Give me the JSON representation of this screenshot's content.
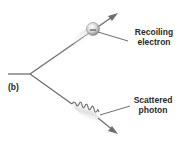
{
  "figure": {
    "panel_label": "(b)",
    "labels": {
      "electron": {
        "line1": "Recoiling",
        "line2": "electron"
      },
      "photon": {
        "line1": "Scattered",
        "line2": "photon"
      }
    },
    "electron_charge_symbol": "−",
    "colors": {
      "line": "#6e6e6e",
      "text": "#2a2a2a",
      "electron_fill": "#d8d8d8",
      "motion_blur": "#e6e6e6",
      "background": "#ffffff"
    }
  }
}
